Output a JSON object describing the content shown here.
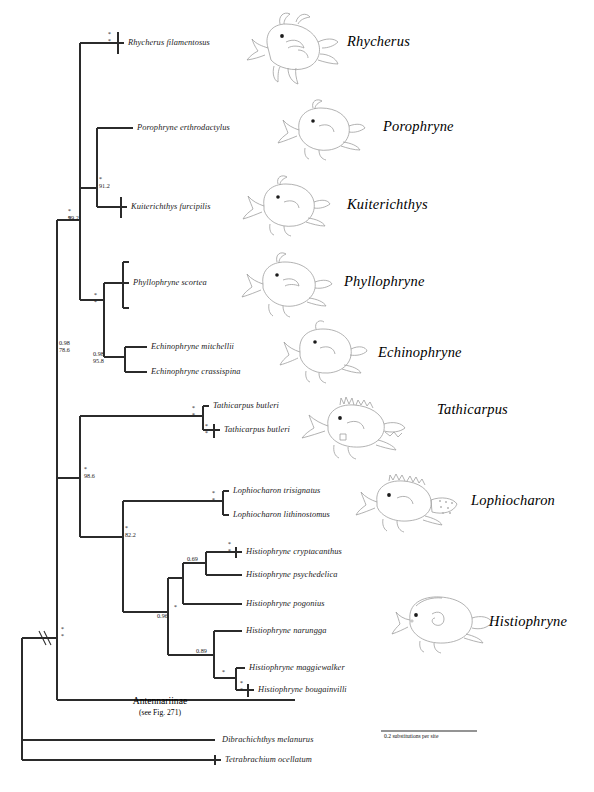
{
  "figure": {
    "type": "phylogenetic-tree",
    "colors": {
      "branch": "#2b2b2b",
      "text": "#111111",
      "fish_outline": "#9a9a9a"
    }
  },
  "scale": {
    "label": "0.2 substitutions per site",
    "value": 0.2,
    "unit": "substitutions per site"
  },
  "tips": [
    {
      "id": "rhycherus_filamentosus",
      "name": "Rhycherus filamentosus"
    },
    {
      "id": "porophryne_erthrodactylus",
      "name": "Porophryne erthrodactylus"
    },
    {
      "id": "kuiterichthys_furcipilis",
      "name": "Kuiterichthys furcipilis"
    },
    {
      "id": "phyllophryne_scortea",
      "name": "Phyllophryne scortea"
    },
    {
      "id": "echinophryne_mitchellii",
      "name": "Echinophryne mitchellii"
    },
    {
      "id": "echinophryne_crassispina",
      "name": "Echinophryne crassispina"
    },
    {
      "id": "tathicarpus_butleri_1",
      "name": "Tathicarpus butleri"
    },
    {
      "id": "tathicarpus_butleri_2",
      "name": "Tathicarpus butleri"
    },
    {
      "id": "lophiocharon_trisignatus",
      "name": "Lophiocharon trisignatus"
    },
    {
      "id": "lophiocharon_lithinostomus",
      "name": "Lophiocharon lithinostomus"
    },
    {
      "id": "histiophryne_cryptacanthus",
      "name": "Histiophryne cryptacanthus"
    },
    {
      "id": "histiophryne_psychedelica",
      "name": "Histiophryne psychedelica"
    },
    {
      "id": "histiophryne_pogonius",
      "name": "Histiophryne pogonius"
    },
    {
      "id": "histiophryne_narungga",
      "name": "Histiophryne narungga"
    },
    {
      "id": "histiophryne_maggiewalker",
      "name": "Histiophryne maggiewalker"
    },
    {
      "id": "histiophryne_bougainvilli",
      "name": "Histiophryne bougainvilli"
    },
    {
      "id": "dibrachichthys_melanurus",
      "name": "Dibrachichthys melanurus"
    },
    {
      "id": "tetrabrachium_ocellatum",
      "name": "Tetrabrachium ocellatum"
    }
  ],
  "clade_labels": [
    {
      "id": "antennariinae",
      "name": "Antennariinae",
      "note": "(see Fig. 271)"
    }
  ],
  "genus_labels": [
    {
      "id": "rhycherus",
      "name": "Rhycherus"
    },
    {
      "id": "porophryne",
      "name": "Porophryne"
    },
    {
      "id": "kuiterichthys",
      "name": "Kuiterichthys"
    },
    {
      "id": "phyllophryne",
      "name": "Phyllophryne"
    },
    {
      "id": "echinophryne",
      "name": "Echinophryne"
    },
    {
      "id": "tathicarpus",
      "name": "Tathicarpus"
    },
    {
      "id": "lophiocharon",
      "name": "Lophiocharon"
    },
    {
      "id": "histiophryne",
      "name": "Histiophryne"
    }
  ],
  "node_support": [
    {
      "id": "n-rhycherus-tip",
      "pp": "*",
      "bs": "*"
    },
    {
      "id": "n-porophryne-kuiterichthys",
      "pp": "*",
      "bs": "91.2"
    },
    {
      "id": "n-upper-clade",
      "pp": "*",
      "bs": "99.2"
    },
    {
      "id": "n-phyllo-echino",
      "pp": "*",
      "bs": "*"
    },
    {
      "id": "n-echinophryne",
      "pp": "0.98",
      "bs": "95.8"
    },
    {
      "id": "n-histiophryninae",
      "pp": "0.98",
      "bs": "78.6"
    },
    {
      "id": "n-tathicarpus-outer",
      "pp": "*",
      "bs": "*"
    },
    {
      "id": "n-tathicarpus-inner",
      "pp": "*",
      "bs": "*"
    },
    {
      "id": "n-tathi-lophio-histio",
      "pp": "*",
      "bs": "98.6"
    },
    {
      "id": "n-lophiocharon",
      "pp": "*",
      "bs": "*"
    },
    {
      "id": "n-lophio-histio",
      "pp": "*",
      "bs": "82.2"
    },
    {
      "id": "n-crypt-pair",
      "pp": "*",
      "bs": "*"
    },
    {
      "id": "n-crypt-psych",
      "pp": "0.69",
      "bs": ""
    },
    {
      "id": "n-crypt-psych-pogon",
      "pp": "*",
      "bs": ""
    },
    {
      "id": "n-histio-upper",
      "pp": "0.96",
      "bs": ""
    },
    {
      "id": "n-histio-lower",
      "pp": "0.89",
      "bs": ""
    },
    {
      "id": "n-maggie-bougain",
      "pp": "*",
      "bs": ""
    },
    {
      "id": "n-bougain-pair",
      "pp": "*",
      "bs": "*"
    },
    {
      "id": "n-root-ingroup",
      "pp": "*",
      "bs": "*"
    }
  ],
  "symbols": {
    "star": "*",
    "branch_break": "//",
    "branch_break_meaning": "branch shortened"
  }
}
